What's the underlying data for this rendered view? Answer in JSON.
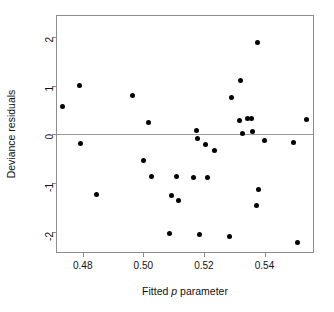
{
  "chart_data": {
    "type": "scatter",
    "title": "",
    "xlabel": "Fitted p parameter",
    "xlabel_parts": {
      "pre": "Fitted ",
      "italic": "p",
      "post": " parameter"
    },
    "ylabel": "Deviance residuals",
    "xlim": [
      0.4715,
      0.556
    ],
    "ylim": [
      -2.42,
      2.43
    ],
    "grid": false,
    "legend": null,
    "xticks": [
      0.48,
      0.5,
      0.52,
      0.54
    ],
    "xtick_labels": [
      "0.48",
      "0.50",
      "0.52",
      "0.54"
    ],
    "yticks": [
      2,
      1,
      0,
      -1,
      -2
    ],
    "ytick_labels": [
      "2",
      "1",
      "0",
      "-1",
      "-2"
    ],
    "reference_lines": [
      {
        "orientation": "horizontal",
        "y": 0,
        "color": "#9a9a9a"
      }
    ],
    "marker": {
      "shape": "circle",
      "color": "#000000",
      "size": 5
    },
    "points": [
      {
        "x": 0.4734,
        "y": 0.57
      },
      {
        "x": 0.479,
        "y": 1.0
      },
      {
        "x": 0.4793,
        "y": -0.18
      },
      {
        "x": 0.4846,
        "y": -1.23
      },
      {
        "x": 0.4964,
        "y": 0.79
      },
      {
        "x": 0.5,
        "y": -0.53
      },
      {
        "x": 0.5016,
        "y": 0.24
      },
      {
        "x": 0.5026,
        "y": -0.87
      },
      {
        "x": 0.5085,
        "y": -2.04
      },
      {
        "x": 0.5092,
        "y": -1.25
      },
      {
        "x": 0.5108,
        "y": -0.87
      },
      {
        "x": 0.5115,
        "y": -1.37
      },
      {
        "x": 0.5167,
        "y": -0.89
      },
      {
        "x": 0.5177,
        "y": 0.08
      },
      {
        "x": 0.518,
        "y": -0.08
      },
      {
        "x": 0.5187,
        "y": -2.06
      },
      {
        "x": 0.5205,
        "y": -0.22
      },
      {
        "x": 0.5213,
        "y": -0.89
      },
      {
        "x": 0.5236,
        "y": -0.34
      },
      {
        "x": 0.5285,
        "y": -2.1
      },
      {
        "x": 0.5292,
        "y": 0.75
      },
      {
        "x": 0.5318,
        "y": 0.28
      },
      {
        "x": 0.5321,
        "y": 1.1
      },
      {
        "x": 0.5328,
        "y": 0.01
      },
      {
        "x": 0.5344,
        "y": 0.32
      },
      {
        "x": 0.5357,
        "y": 0.32
      },
      {
        "x": 0.5361,
        "y": 0.06
      },
      {
        "x": 0.5374,
        "y": -1.47
      },
      {
        "x": 0.5377,
        "y": 1.88
      },
      {
        "x": 0.538,
        "y": -1.13
      },
      {
        "x": 0.54,
        "y": -0.12
      },
      {
        "x": 0.5496,
        "y": -0.17
      },
      {
        "x": 0.5508,
        "y": -2.22
      },
      {
        "x": 0.5539,
        "y": 0.31
      }
    ]
  }
}
